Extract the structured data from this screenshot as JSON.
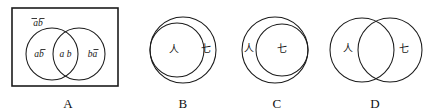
{
  "figure": {
    "type": "venn-euler-diagram-set",
    "panel_count": 4,
    "ink_color": "#1b1b1b",
    "background_color": "#ffffff"
  },
  "panels": [
    {
      "caption": "A",
      "shape": "rectangle-with-two-overlapping-circles",
      "has_universe_rect": true,
      "labels": {
        "universe": "ā b̄",
        "universe_plain": "ab",
        "left_only": "a b̄",
        "left_only_plain": "ab",
        "intersection": "a b",
        "right_only": "b ā",
        "right_only_plain": "ba"
      }
    },
    {
      "caption": "B",
      "shape": "inner-circle-tangent-left",
      "has_universe_rect": false,
      "labels": {
        "inner": "人",
        "outer": "七"
      }
    },
    {
      "caption": "C",
      "shape": "inner-circle-tangent-right",
      "has_universe_rect": false,
      "labels": {
        "inner": "七",
        "outer": "人"
      }
    },
    {
      "caption": "D",
      "shape": "two-overlapping-circles",
      "has_universe_rect": false,
      "labels": {
        "left": "人",
        "right": "七"
      }
    }
  ]
}
